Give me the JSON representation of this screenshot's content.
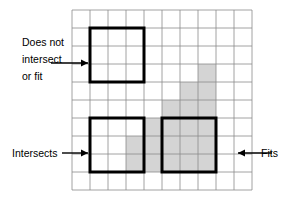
{
  "figure": {
    "background_color": "#ffffff"
  },
  "grid": {
    "name": "reference-grid",
    "columns": 10,
    "rows": 10,
    "cell_size": 18,
    "origin_x": 72,
    "origin_y": 10,
    "line_color": "#8c8c8c",
    "line_width": 0.8,
    "border_color": "#8c8c8c"
  },
  "shaded_region": {
    "name": "shaded-polygon",
    "fill_color": "#d4d4d4",
    "stroke_color": "#c0c0c0",
    "description": "L-shaped gray region of grid cells",
    "cells": [
      {
        "col": 7,
        "row": 3
      },
      {
        "col": 6,
        "row": 4
      },
      {
        "col": 7,
        "row": 4
      },
      {
        "col": 4,
        "row": 6
      },
      {
        "col": 5,
        "row": 6
      },
      {
        "col": 6,
        "row": 6
      },
      {
        "col": 7,
        "row": 6
      },
      {
        "col": 3,
        "row": 7
      },
      {
        "col": 4,
        "row": 7
      },
      {
        "col": 5,
        "row": 7
      },
      {
        "col": 6,
        "row": 7
      },
      {
        "col": 7,
        "row": 7
      },
      {
        "col": 3,
        "row": 8
      },
      {
        "col": 4,
        "row": 8
      },
      {
        "col": 5,
        "row": 8
      },
      {
        "col": 6,
        "row": 8
      },
      {
        "col": 7,
        "row": 8
      },
      {
        "col": 5,
        "row": 5
      },
      {
        "col": 6,
        "row": 5
      },
      {
        "col": 7,
        "row": 5
      }
    ]
  },
  "squares": [
    {
      "id": "square-does-not-intersect",
      "name": "query-square-does-not-intersect",
      "col": 1,
      "row": 1,
      "width_cells": 3,
      "height_cells": 3,
      "stroke_color": "#000000",
      "stroke_width": 3,
      "fill": "none"
    },
    {
      "id": "square-intersects",
      "name": "query-square-intersects",
      "col": 1,
      "row": 6,
      "width_cells": 3,
      "height_cells": 3,
      "stroke_color": "#000000",
      "stroke_width": 3,
      "fill": "none"
    },
    {
      "id": "square-fits",
      "name": "query-square-fits",
      "col": 5,
      "row": 6,
      "width_cells": 3,
      "height_cells": 3,
      "stroke_color": "#000000",
      "stroke_width": 3,
      "fill": "none"
    }
  ],
  "annotations": [
    {
      "id": "annotation-does-not-intersect",
      "name": "label-does-not-intersect",
      "lines": [
        "Does not",
        "intersect",
        "or fit"
      ],
      "arrow_line_index": 1,
      "text_x": 22,
      "text_y": 46,
      "line_height": 17,
      "arrow": {
        "name": "arrow-does-not-intersect",
        "direction": "right",
        "x1": 51,
        "y1": 63,
        "x2": 88,
        "y2": 63,
        "color": "#000000"
      }
    },
    {
      "id": "annotation-intersects",
      "name": "label-intersects",
      "lines": [
        "Intersects"
      ],
      "arrow_line_index": 0,
      "text_x": 12,
      "text_y": 157,
      "line_height": 17,
      "arrow": {
        "name": "arrow-intersects",
        "direction": "right",
        "x1": 62,
        "y1": 153,
        "x2": 88,
        "y2": 153,
        "color": "#000000"
      }
    },
    {
      "id": "annotation-fits",
      "name": "label-fits",
      "lines": [
        "Fits"
      ],
      "arrow_line_index": 0,
      "text_x": 278,
      "text_y": 157,
      "line_height": 17,
      "arrow": {
        "name": "arrow-fits",
        "direction": "left",
        "x1": 272,
        "y1": 153,
        "x2": 238,
        "y2": 153,
        "color": "#000000"
      }
    }
  ],
  "labels": {
    "does_not_intersect_line1": "Does not",
    "does_not_intersect_line2": "intersect",
    "does_not_intersect_line3": "or fit",
    "intersects": "Intersects",
    "fits": "Fits"
  }
}
